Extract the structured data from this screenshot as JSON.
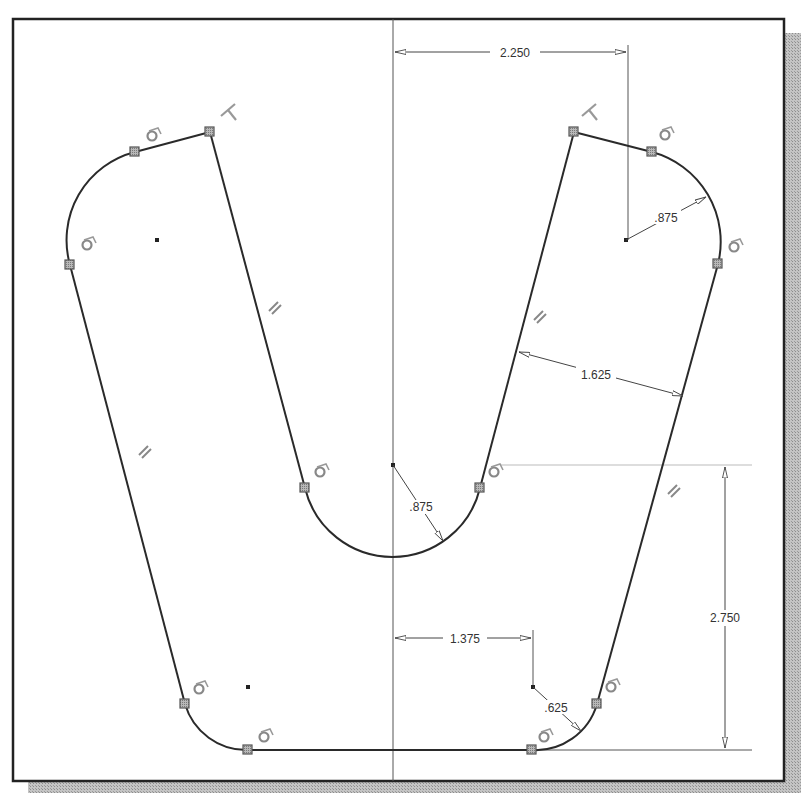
{
  "frame": {
    "border_color": "#222222",
    "shadow_color": "#b0b0b0",
    "background": "#ffffff"
  },
  "sketch": {
    "line_color": "#2a2a2a",
    "point_fill": "#9a9a9a",
    "construction_color": "#555555",
    "constraint_icons": {
      "tangent": "tangent-icon",
      "perpendicular": "perpendicular-icon",
      "parallel": "parallel-icon"
    }
  },
  "dimensions": [
    {
      "id": "dim-2250",
      "label": "2.250",
      "type": "horizontal",
      "description": "Distance from center axis to top-right arc center"
    },
    {
      "id": "dim-875-top",
      "label": ".875",
      "type": "radius",
      "description": "Top-right arc radius"
    },
    {
      "id": "dim-1625",
      "label": "1.625",
      "type": "aligned",
      "description": "Right leg width"
    },
    {
      "id": "dim-875-center",
      "label": ".875",
      "type": "radius",
      "description": "Inner U-arc radius"
    },
    {
      "id": "dim-2750",
      "label": "2.750",
      "type": "vertical",
      "description": "Height from inner arc center to bottom line"
    },
    {
      "id": "dim-1375",
      "label": "1.375",
      "type": "horizontal",
      "description": "Distance from center axis to bottom-right arc center"
    },
    {
      "id": "dim-625",
      "label": ".625",
      "type": "radius",
      "description": "Bottom-right arc radius"
    }
  ]
}
